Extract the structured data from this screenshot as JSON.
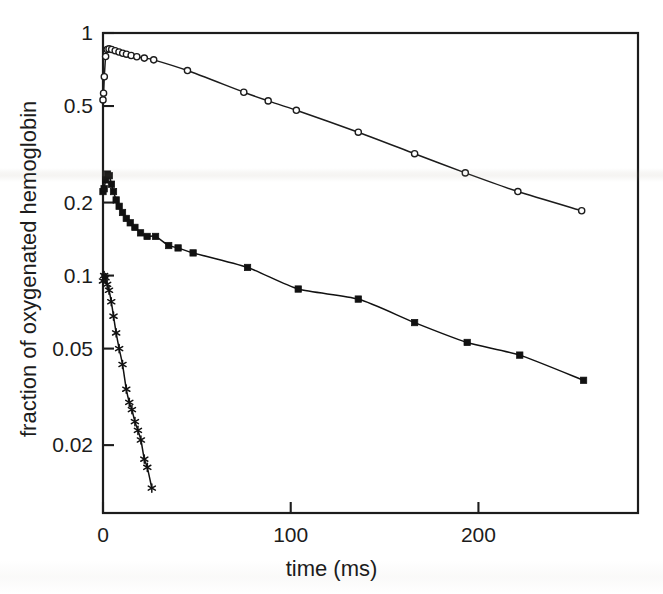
{
  "figure": {
    "background_color": "#ffffff",
    "ink_color": "#1c1c1c"
  },
  "chart_data": {
    "type": "line",
    "title": "",
    "subtitle": "",
    "xlabel": "time (ms)",
    "ylabel": "fraction of oxygenated hemoglobin",
    "xscale": "linear",
    "yscale": "log",
    "xlim": [
      0,
      285
    ],
    "ylim": [
      0.0105,
      1.0
    ],
    "grid": false,
    "legend": "none",
    "xticks": [
      0,
      100,
      200
    ],
    "xtick_labels": [
      "0",
      "100",
      "200"
    ],
    "yticks": [
      1,
      0.5,
      0.2,
      0.1,
      0.05,
      0.02
    ],
    "ytick_labels": [
      "1",
      "0.5",
      "0.2",
      "0.1",
      "0.05",
      "0.02"
    ],
    "series": [
      {
        "name": "top trace",
        "marker": "open-circle",
        "marker_size": 5,
        "line": "solid",
        "color": "#1c1c1c",
        "fill": "#ffffff",
        "points": [
          {
            "x": 0.0,
            "y": 0.53
          },
          {
            "x": 0.3,
            "y": 0.565
          },
          {
            "x": 0.7,
            "y": 0.66
          },
          {
            "x": 1.4,
            "y": 0.8
          },
          {
            "x": 2.2,
            "y": 0.855
          },
          {
            "x": 3.2,
            "y": 0.86
          },
          {
            "x": 4.6,
            "y": 0.855
          },
          {
            "x": 6.5,
            "y": 0.845
          },
          {
            "x": 8.5,
            "y": 0.835
          },
          {
            "x": 10.5,
            "y": 0.825
          },
          {
            "x": 12.5,
            "y": 0.818
          },
          {
            "x": 15.0,
            "y": 0.808
          },
          {
            "x": 18.0,
            "y": 0.798
          },
          {
            "x": 22.0,
            "y": 0.788
          },
          {
            "x": 27.0,
            "y": 0.775
          },
          {
            "x": 45.0,
            "y": 0.7
          },
          {
            "x": 75.0,
            "y": 0.57
          },
          {
            "x": 88.0,
            "y": 0.525
          },
          {
            "x": 103.0,
            "y": 0.48
          },
          {
            "x": 136.0,
            "y": 0.39
          },
          {
            "x": 166.0,
            "y": 0.318
          },
          {
            "x": 193.0,
            "y": 0.265
          },
          {
            "x": 221.0,
            "y": 0.222
          },
          {
            "x": 255.0,
            "y": 0.185
          }
        ]
      },
      {
        "name": "middle trace",
        "marker": "filled-square",
        "marker_size": 5,
        "line": "solid",
        "color": "#111111",
        "fill": "#111111",
        "points": [
          {
            "x": 0.0,
            "y": 0.222
          },
          {
            "x": 0.6,
            "y": 0.228
          },
          {
            "x": 1.4,
            "y": 0.248
          },
          {
            "x": 2.4,
            "y": 0.262
          },
          {
            "x": 3.4,
            "y": 0.258
          },
          {
            "x": 4.5,
            "y": 0.238
          },
          {
            "x": 5.6,
            "y": 0.222
          },
          {
            "x": 7.0,
            "y": 0.205
          },
          {
            "x": 8.6,
            "y": 0.193
          },
          {
            "x": 10.4,
            "y": 0.182
          },
          {
            "x": 12.4,
            "y": 0.172
          },
          {
            "x": 14.5,
            "y": 0.165
          },
          {
            "x": 17.0,
            "y": 0.158
          },
          {
            "x": 20.0,
            "y": 0.15
          },
          {
            "x": 23.5,
            "y": 0.145
          },
          {
            "x": 28.0,
            "y": 0.145
          },
          {
            "x": 35.0,
            "y": 0.133
          },
          {
            "x": 40.0,
            "y": 0.13
          },
          {
            "x": 48.0,
            "y": 0.124
          },
          {
            "x": 77.0,
            "y": 0.108
          },
          {
            "x": 104.0,
            "y": 0.088
          },
          {
            "x": 136.0,
            "y": 0.08
          },
          {
            "x": 166.0,
            "y": 0.064
          },
          {
            "x": 194.0,
            "y": 0.053
          },
          {
            "x": 222.0,
            "y": 0.047
          },
          {
            "x": 256.0,
            "y": 0.037
          }
        ]
      },
      {
        "name": "bottom trace",
        "marker": "asterisk",
        "marker_size": 6,
        "line": "solid",
        "color": "#111111",
        "fill": "#111111",
        "points": [
          {
            "x": 0.0,
            "y": 0.095
          },
          {
            "x": 0.6,
            "y": 0.1
          },
          {
            "x": 1.3,
            "y": 0.098
          },
          {
            "x": 2.2,
            "y": 0.092
          },
          {
            "x": 3.2,
            "y": 0.087
          },
          {
            "x": 4.4,
            "y": 0.078
          },
          {
            "x": 5.6,
            "y": 0.068
          },
          {
            "x": 7.0,
            "y": 0.058
          },
          {
            "x": 8.6,
            "y": 0.05
          },
          {
            "x": 10.4,
            "y": 0.043
          },
          {
            "x": 12.4,
            "y": 0.034
          },
          {
            "x": 14.0,
            "y": 0.03
          },
          {
            "x": 15.4,
            "y": 0.028
          },
          {
            "x": 17.0,
            "y": 0.025
          },
          {
            "x": 18.6,
            "y": 0.023
          },
          {
            "x": 20.2,
            "y": 0.021
          },
          {
            "x": 22.0,
            "y": 0.0175
          },
          {
            "x": 23.6,
            "y": 0.0162
          },
          {
            "x": 26.0,
            "y": 0.0133
          }
        ]
      }
    ]
  }
}
